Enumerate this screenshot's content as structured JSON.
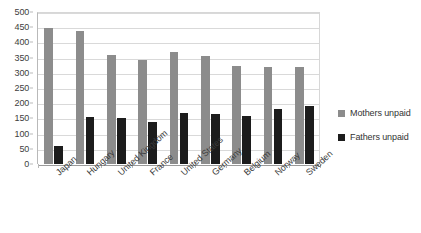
{
  "chart_data": {
    "type": "bar",
    "title": "",
    "xlabel": "",
    "ylabel": "",
    "ylim": [
      0,
      500
    ],
    "ytick_step": 50,
    "yticks": [
      500,
      450,
      400,
      350,
      300,
      250,
      200,
      150,
      100,
      50,
      0
    ],
    "grid": true,
    "legend_position": "right",
    "categories": [
      "Japan",
      "Hungary",
      "United Kingdom",
      "France",
      "United States",
      "Germany",
      "Belgium",
      "Norway",
      "Sweden"
    ],
    "series": [
      {
        "name": "Mothers unpaid",
        "color": "#8c8c8c",
        "values": [
          448,
          437,
          360,
          342,
          370,
          355,
          322,
          320,
          318
        ]
      },
      {
        "name": "Fathers unpaid",
        "color": "#1c1c1c",
        "values": [
          60,
          155,
          152,
          138,
          167,
          165,
          158,
          180,
          190
        ]
      }
    ]
  },
  "legend": {
    "items": [
      {
        "label": "Mothers unpaid",
        "swatch": "mothers"
      },
      {
        "label": "Fathers unpaid",
        "swatch": "fathers"
      }
    ]
  }
}
